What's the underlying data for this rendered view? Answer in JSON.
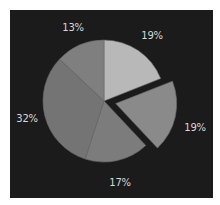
{
  "chart_data": {
    "type": "pie",
    "title": "",
    "categories": [
      "Slice 1",
      "Slice 2",
      "Slice 3",
      "Slice 4",
      "Slice 5"
    ],
    "values": [
      19,
      19,
      17,
      32,
      13
    ],
    "labels": [
      "19%",
      "19%",
      "17%",
      "32%",
      "13%"
    ],
    "colors": [
      "#b8b8b8",
      "#8a8a8a",
      "#7c7c7c",
      "#747474",
      "#7f7f7f"
    ],
    "exploded": [
      false,
      true,
      false,
      false,
      false
    ],
    "start_angle": "12 o'clock",
    "direction": "clockwise",
    "legend": "none",
    "background": "#1b1b1b"
  },
  "labels": {
    "s1": "19%",
    "s2": "19%",
    "s3": "17%",
    "s4": "32%",
    "s5": "13%"
  }
}
